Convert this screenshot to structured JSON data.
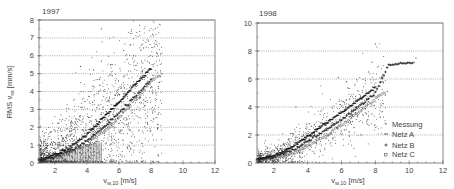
{
  "chart_data": [
    {
      "type": "scatter",
      "title": "1997",
      "xlabel": "v_w,10 [m/s]",
      "ylabel": "RMS v_sx [mm/s]",
      "xlim": [
        1,
        12
      ],
      "ylim": [
        0,
        8
      ],
      "xticks": [
        2,
        4,
        6,
        8,
        10,
        12
      ],
      "yticks": [
        0,
        1,
        2,
        3,
        4,
        5,
        6,
        7,
        8
      ],
      "grid": "horizontal dotted",
      "series": [
        {
          "name": "Messung",
          "marker": "dot",
          "description": "dense scatter cloud, 1-8.6 m/s, 0-7.5 mm/s"
        },
        {
          "name": "Netz A",
          "marker": "dash",
          "curve": [
            [
              1,
              0.2
            ],
            [
              2,
              0.45
            ],
            [
              3,
              0.9
            ],
            [
              4,
              1.6
            ],
            [
              5,
              2.5
            ],
            [
              6,
              3.4
            ],
            [
              7,
              4.4
            ],
            [
              8,
              5.3
            ]
          ]
        },
        {
          "name": "Netz B",
          "marker": "plus",
          "curve": [
            [
              1,
              0.15
            ],
            [
              2,
              0.35
            ],
            [
              3,
              0.7
            ],
            [
              4,
              1.25
            ],
            [
              5,
              1.95
            ],
            [
              6,
              2.8
            ],
            [
              7,
              3.7
            ],
            [
              8,
              4.6
            ]
          ]
        },
        {
          "name": "Netz C",
          "marker": "circle",
          "curve": [
            [
              1,
              0.15
            ],
            [
              2,
              0.3
            ],
            [
              3,
              0.6
            ],
            [
              4,
              1.05
            ],
            [
              5,
              1.7
            ],
            [
              6,
              2.5
            ],
            [
              7,
              3.5
            ],
            [
              8,
              4.5
            ],
            [
              8.6,
              5.0
            ]
          ]
        }
      ]
    },
    {
      "type": "scatter",
      "title": "1998",
      "xlabel": "v_w,10 [m/s]",
      "ylabel": "",
      "xlim": [
        1,
        12
      ],
      "ylim": [
        0,
        10
      ],
      "xticks": [
        2,
        4,
        6,
        8,
        10,
        12
      ],
      "yticks": [
        0,
        2,
        4,
        6,
        8,
        10
      ],
      "grid": "horizontal dotted",
      "legend": {
        "position": "lower right",
        "entries": [
          "Messung",
          "Netz A",
          "Netz B",
          "Netz C"
        ]
      },
      "series": [
        {
          "name": "Messung",
          "marker": "dot",
          "description": "scatter cloud, 1-10.3 m/s, 0-8.5 mm/s"
        },
        {
          "name": "Netz A",
          "marker": "dash",
          "curve": [
            [
              1,
              0.3
            ],
            [
              2,
              0.5
            ],
            [
              3,
              1.1
            ],
            [
              4,
              1.9
            ],
            [
              5,
              2.8
            ],
            [
              6,
              3.6
            ],
            [
              7,
              4.5
            ],
            [
              8,
              5.4
            ]
          ]
        },
        {
          "name": "Netz B",
          "marker": "plus",
          "curve": [
            [
              1,
              0.25
            ],
            [
              2,
              0.4
            ],
            [
              3,
              0.85
            ],
            [
              4,
              1.5
            ],
            [
              5,
              2.3
            ],
            [
              6,
              3.1
            ],
            [
              7,
              4.0
            ],
            [
              8,
              5.0
            ],
            [
              8.8,
              7.0
            ],
            [
              10.3,
              7.2
            ]
          ]
        },
        {
          "name": "Netz C",
          "marker": "circle",
          "curve": [
            [
              1,
              0.2
            ],
            [
              2,
              0.3
            ],
            [
              3,
              0.65
            ],
            [
              4,
              1.2
            ],
            [
              5,
              1.9
            ],
            [
              6,
              2.7
            ],
            [
              7,
              3.6
            ],
            [
              8,
              4.6
            ],
            [
              8.5,
              5.0
            ]
          ]
        }
      ]
    }
  ],
  "labels": {
    "left_title": "1997",
    "right_title": "1998",
    "y_axis_label": "RMS v",
    "y_axis_sub": "sx",
    "y_axis_unit": "[mm/s]",
    "x_axis_label": "v",
    "x_axis_sub": "w,10",
    "x_axis_unit": "[m/s]",
    "legend": [
      "Messung",
      "Netz A",
      "Netz B",
      "Netz C"
    ]
  }
}
